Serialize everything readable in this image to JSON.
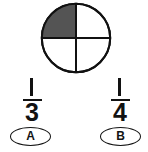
{
  "figure": {
    "name": "circle-divided-in-quarters",
    "shape": "circle",
    "total_parts": 4,
    "shaded_parts": 1,
    "shaded_quadrant": "upper-left",
    "outline_color": "#111111",
    "shaded_color": "#545454",
    "unshaded_color": "#ffffff",
    "divider_color": "#111111"
  },
  "choices": [
    {
      "letter": "A",
      "numerator": "1",
      "denominator": "3",
      "fraction_text": "1/3"
    },
    {
      "letter": "B",
      "numerator": "1",
      "denominator": "4",
      "fraction_text": "1/4"
    }
  ]
}
